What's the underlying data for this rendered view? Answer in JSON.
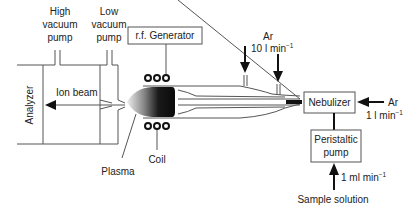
{
  "diagram": {
    "labels": {
      "high_vacuum_pump": [
        "High",
        "vacuum",
        "pump"
      ],
      "low_vacuum_pump": [
        "Low",
        "vacuum",
        "pump"
      ],
      "rf_generator": "r.f. Generator",
      "analyzer": "Analyzer",
      "ion_beam": "Ion beam",
      "plasma": "Plasma",
      "coil": "Coil",
      "nebulizer": "Nebulizer",
      "peristaltic_pump": [
        "Peristaltic",
        "pump"
      ],
      "sample_solution": "Sample solution",
      "ar_top": "Ar",
      "ar_top_flow": "10 l min",
      "ar_top_flow_sup": "−1",
      "ar_right": "Ar",
      "ar_right_flow": "1 l min",
      "ar_right_flow_sup": "−1",
      "sample_flow": "1 ml min",
      "sample_flow_sup": "−1"
    },
    "colors": {
      "line": "#555555",
      "arrow": "#111111",
      "plasma_dark": "#111111",
      "plasma_light": "#e8e8e8",
      "text": "#222222"
    }
  }
}
